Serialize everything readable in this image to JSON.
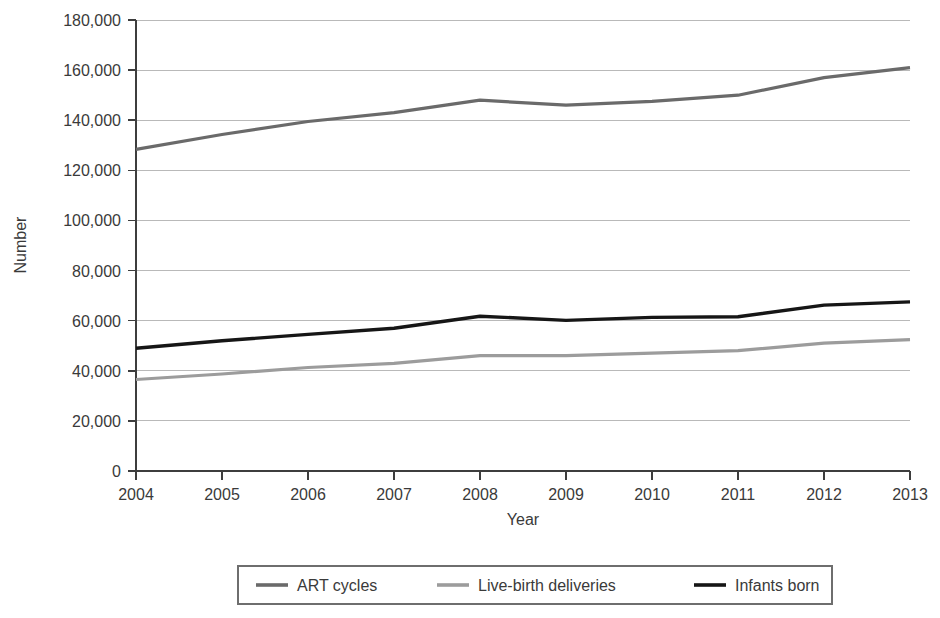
{
  "chart_data": {
    "type": "line",
    "title": "",
    "xlabel": "Year",
    "ylabel": "Number",
    "categories": [
      "2004",
      "2005",
      "2006",
      "2007",
      "2008",
      "2009",
      "2010",
      "2011",
      "2012",
      "2013"
    ],
    "x": [
      2004,
      2005,
      2006,
      2007,
      2008,
      2009,
      2010,
      2011,
      2012,
      2013
    ],
    "xlim": [
      2004,
      2013
    ],
    "ylim": [
      0,
      180000
    ],
    "ytick_values": [
      0,
      20000,
      40000,
      60000,
      80000,
      100000,
      120000,
      140000,
      160000,
      180000
    ],
    "ytick_labels": [
      "0",
      "20,000",
      "40,000",
      "60,000",
      "80,000",
      "100,000",
      "120,000",
      "140,000",
      "160,000",
      "180,000"
    ],
    "grid": "horizontal",
    "legend_position": "bottom-center",
    "series": [
      {
        "name": "ART cycles",
        "color": "#6a6a6a",
        "linewidth": 3.2,
        "values": [
          128400,
          134300,
          139500,
          143000,
          148000,
          146000,
          147500,
          150000,
          157000,
          161000
        ]
      },
      {
        "name": "Live-birth deliveries",
        "color": "#9c9c9c",
        "linewidth": 3.2,
        "values": [
          36500,
          38700,
          41300,
          43000,
          46000,
          46000,
          47000,
          48000,
          51000,
          52400
        ]
      },
      {
        "name": "Infants born",
        "color": "#161616",
        "linewidth": 3.4,
        "values": [
          49000,
          52000,
          54500,
          57000,
          61800,
          60100,
          61300,
          61600,
          66200,
          67500
        ]
      }
    ]
  },
  "legend": {
    "entries": [
      {
        "label": "ART cycles",
        "color": "#6a6a6a"
      },
      {
        "label": "Live-birth deliveries",
        "color": "#9c9c9c"
      },
      {
        "label": "Infants born",
        "color": "#161616"
      }
    ]
  },
  "axes": {
    "y_title": "Number",
    "x_title": "Year"
  },
  "colors": {
    "gridline": "#b9b9b9",
    "axis": "#3d3d3d",
    "text": "#3a3a3a",
    "background": "#ffffff"
  }
}
